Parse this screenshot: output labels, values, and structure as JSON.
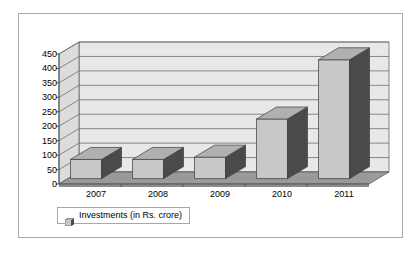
{
  "chart_data": {
    "type": "bar",
    "title": "",
    "subtitle": "",
    "xlabel": "",
    "ylabel": "",
    "categories": [
      "2007",
      "2008",
      "2009",
      "2010",
      "2011"
    ],
    "values": [
      85,
      85,
      93,
      225,
      430
    ],
    "series": [
      {
        "name": "Investments (in Rs. crore)",
        "values": [
          85,
          85,
          93,
          225,
          430
        ]
      }
    ],
    "ylim": [
      0,
      450
    ],
    "ytick_step": 50,
    "ytick_labels": [
      "0",
      "50",
      "100",
      "150",
      "200",
      "250",
      "300",
      "350",
      "400",
      "450"
    ],
    "ytick_values": [
      0,
      50,
      100,
      150,
      200,
      250,
      300,
      350,
      400,
      450
    ],
    "grid": true,
    "grid_axis": "y",
    "legend_position": "bottom-left",
    "three_d": true,
    "annotations": []
  },
  "legend": {
    "entries": [
      {
        "label": "Investments (in Rs. crore)",
        "swatch_face": "#c8c8c8",
        "swatch_side": "#4a4a4a"
      }
    ]
  },
  "colors": {
    "page_background": "#ffffff",
    "frame_border": "#a8a8a8",
    "plot_wall": "#e8e8e8",
    "plot_wall_side": "#dcdcdc",
    "plot_floor": "#9a9a9a",
    "plot_floor_side": "#8c8c8c",
    "gridline": "#6e6e6e",
    "axis_line": "#555555",
    "bar_face": "#c8c8c8",
    "bar_side": "#4a4a4a",
    "bar_top": "#b0b0b0",
    "bar_outline": "#3c3c3c",
    "tick_text": "#000000"
  },
  "icons": {
    "legend_swatch": "legend-swatch-icon"
  }
}
